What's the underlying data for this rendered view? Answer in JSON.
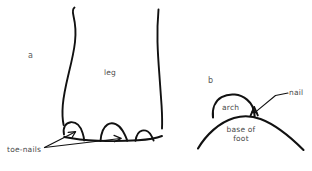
{
  "figure": {
    "type": "hand-drawn-line-diagram",
    "background_color": "#ffffff",
    "ink_color": "#111111",
    "text_color": "#4a4a4a",
    "panels": [
      {
        "id": "a",
        "label": "a",
        "label_x": 30,
        "label_y": 53,
        "subject": "leg",
        "parts": [
          {
            "name": "leg",
            "label": "leg",
            "x": 104,
            "y": 69
          },
          {
            "name": "toe-nails",
            "label": "toe-nails",
            "x": 8,
            "y": 146
          }
        ]
      },
      {
        "id": "b",
        "label": "b",
        "label_x": 209,
        "label_y": 78,
        "subject": "foot cross-section",
        "parts": [
          {
            "name": "arch",
            "label": "arch",
            "x": 221,
            "y": 104
          },
          {
            "name": "nail",
            "label": "nail",
            "x": 277,
            "y": 88
          },
          {
            "name": "base-of-foot",
            "label": "base of\nfoot",
            "x": 222,
            "y": 124
          }
        ]
      }
    ],
    "annotations": {
      "arrow_count": 2,
      "arrow_source": "toe-nails",
      "leader_line_target": "nail"
    }
  },
  "labels": {
    "panel_a": "a",
    "panel_b": "b",
    "leg": "leg",
    "toe_nails": "toe-nails",
    "arch": "arch",
    "nail": "nail",
    "base_of_foot_line1": "base of",
    "base_of_foot_line2": "foot"
  }
}
